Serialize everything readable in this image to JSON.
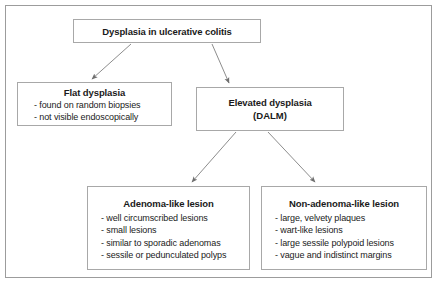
{
  "figure": {
    "colors": {
      "background": "#ffffff",
      "frame_border": "#9c9c9c",
      "box_border": "#a8a8a8",
      "text": "#1a1a1a",
      "arrow": "#8d8d8d",
      "arrow_head": "#6f6f6f"
    }
  },
  "nodes": {
    "root": {
      "title": "Dysplasia in ulcerative colitis"
    },
    "flat": {
      "title": "Flat dysplasia",
      "items": [
        "- found on random biopsies",
        "- not visible endoscopically"
      ]
    },
    "elevated": {
      "title": "Elevated dysplasia",
      "subtitle": "(DALM)"
    },
    "adenoma": {
      "title": "Adenoma-like lesion",
      "items": [
        "- well circumscribed lesions",
        "- small lesions",
        "- similar to sporadic adenomas",
        "- sessile or pedunculated polyps"
      ]
    },
    "nonadenoma": {
      "title": "Non-adenoma-like lesion",
      "items": [
        "- large, velvety plaques",
        "- wart-like lesions",
        "- large sessile polypoid lesions",
        "- vague and indistinct margins"
      ]
    }
  },
  "edges": [
    {
      "id": "root-to-flat",
      "from": "root",
      "to": "flat",
      "direction": "down-left"
    },
    {
      "id": "root-to-elevated",
      "from": "root",
      "to": "elevated",
      "direction": "down-right"
    },
    {
      "id": "elevated-to-adenoma",
      "from": "elevated",
      "to": "adenoma",
      "direction": "down-left"
    },
    {
      "id": "elevated-to-nonadenoma",
      "from": "elevated",
      "to": "nonadenoma",
      "direction": "down-right"
    }
  ]
}
